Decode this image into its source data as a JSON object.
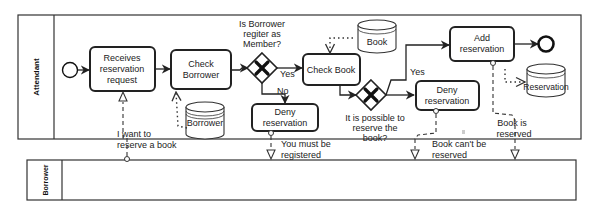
{
  "lanes": {
    "attendant": "Attendant",
    "borrower": "Borrower"
  },
  "tasks": {
    "receives": [
      "Receives",
      "reservation",
      "request"
    ],
    "check_borrower": [
      "Check",
      "Borrower"
    ],
    "check_book": "Check Book",
    "deny1": [
      "Deny",
      "reservation"
    ],
    "deny2": [
      "Deny",
      "reservation"
    ],
    "add": [
      "Add",
      "reservation"
    ]
  },
  "gateways": {
    "g1_question": [
      "Is Borrower",
      "regiter as",
      "Member?"
    ],
    "g2_question": [
      "It is possible to",
      "reserve the",
      "book?"
    ]
  },
  "flow_labels": {
    "g1_yes": "Yes",
    "g1_no": "No",
    "g2_yes": "Yes"
  },
  "data_stores": {
    "borrower": "Borrower",
    "book": "Book",
    "reservation": "Reservation"
  },
  "messages": {
    "m1": [
      "I want to",
      "reserve a book"
    ],
    "m2": [
      "You must be",
      "registered"
    ],
    "m3": [
      "Book can't be",
      "reserved"
    ],
    "m4": [
      "Book is",
      "reserved"
    ]
  }
}
